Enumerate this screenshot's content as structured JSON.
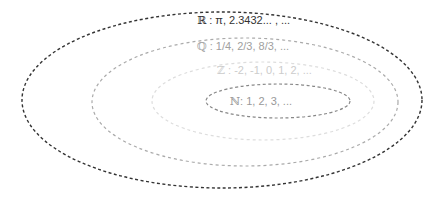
{
  "diagram": {
    "sets": [
      {
        "id": "real",
        "symbol": "ℝ",
        "label": " : π, 2.3432... , ...",
        "ellipse": {
          "cx": 222,
          "cy": 100,
          "rx": 200,
          "ry": 88
        },
        "stroke": "#333333",
        "text_color": "#333333",
        "label_pos": {
          "x": 197,
          "y": 14
        }
      },
      {
        "id": "rational",
        "symbol": "ℚ",
        "label": " : 1/4, 2/3, 8/3, ...",
        "ellipse": {
          "cx": 245,
          "cy": 102,
          "rx": 153,
          "ry": 64
        },
        "stroke": "#aaaaaa",
        "text_color": "#a0a0a0",
        "label_pos": {
          "x": 197,
          "y": 40
        }
      },
      {
        "id": "integer",
        "symbol": "ℤ",
        "label": " : -2, -1, 0, 1, 2, ...",
        "ellipse": {
          "cx": 263,
          "cy": 101,
          "rx": 111,
          "ry": 39
        },
        "stroke": "#dddddd",
        "text_color": "#cccccc",
        "label_pos": {
          "x": 217,
          "y": 64
        }
      },
      {
        "id": "natural",
        "symbol": "ℕ",
        "label": ": 1, 2, 3, ...",
        "ellipse": {
          "cx": 278,
          "cy": 101,
          "rx": 72,
          "ry": 17
        },
        "stroke": "#888888",
        "text_color": "#999999",
        "label_pos": {
          "x": 230,
          "y": 95
        }
      }
    ]
  }
}
